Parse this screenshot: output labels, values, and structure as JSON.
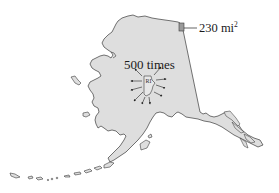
{
  "figure": {
    "scale_label": "500 times",
    "inset_state_label": "RI",
    "area_callout": {
      "value": "230",
      "unit": "mi",
      "exponent": "2"
    },
    "colors": {
      "land_fill": "#dedede",
      "outline": "#3a3a3a",
      "highlight_square": "#9a9a9a",
      "arrow": "#222222",
      "background": "#ffffff"
    },
    "arrow_count": 10
  }
}
